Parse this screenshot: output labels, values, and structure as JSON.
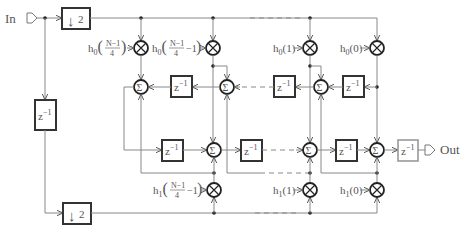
{
  "diagram": {
    "type": "polyphase-filter-block-diagram",
    "input_label": "In",
    "output_label": "Out",
    "downsampler_label": "2",
    "delay_label": "z",
    "delay_exponent": "-1",
    "sum_symbol": "Σ",
    "multiply_symbol": "⊗",
    "top_branch": {
      "coefficients": [
        {
          "prefix": "h",
          "sub": "0",
          "num": "N−1",
          "den": "4",
          "suffix": ""
        },
        {
          "prefix": "h",
          "sub": "0",
          "num": "N−1",
          "den": "4",
          "suffix": "−1"
        },
        {
          "prefix": "h",
          "sub": "0",
          "arg": "(1)"
        },
        {
          "prefix": "h",
          "sub": "0",
          "arg": "(0)"
        }
      ]
    },
    "bottom_branch": {
      "coefficients": [
        {
          "prefix": "h",
          "sub": "1",
          "num": "N−1",
          "den": "4",
          "suffix": "−1"
        },
        {
          "prefix": "h",
          "sub": "1",
          "arg": "(1)"
        },
        {
          "prefix": "h",
          "sub": "1",
          "arg": "(0)"
        }
      ]
    },
    "colors": {
      "wire": "#888888",
      "block_border": "#333333",
      "output_delay_border": "#999999",
      "text": "#555555"
    }
  }
}
